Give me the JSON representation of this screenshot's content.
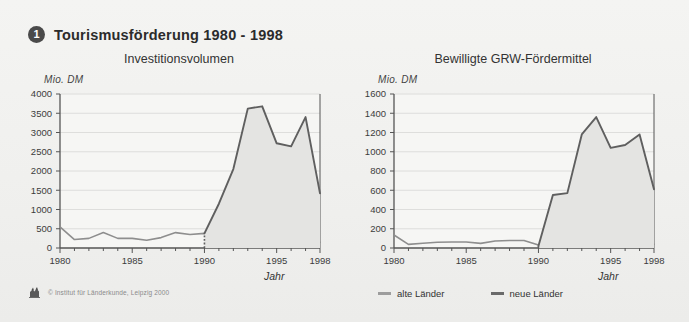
{
  "header": {
    "badge": "1",
    "title": "Tourismusförderung 1980 - 1998"
  },
  "legend": {
    "items": [
      {
        "label": "alte Länder",
        "color": "#9d9d9d"
      },
      {
        "label": "neue Länder",
        "color": "#6a6a6a"
      }
    ]
  },
  "footer": {
    "copyright": "© Institut für Länderkunde, Leipzig 2000",
    "logo_icon": "institute-logo-icon"
  },
  "colors": {
    "line_alte": "#8e8e8e",
    "line_neue": "#5f5f5f",
    "area_fill": "#e4e4e2",
    "grid": "#d8d8d6",
    "axis": "#555555",
    "plot_bg": "#f6f6f4"
  },
  "chart_data": [
    {
      "type": "line",
      "id": "investitionsvolumen",
      "title": "Investitionsvolumen",
      "ylabel": "Mio. DM",
      "xlabel": "Jahr",
      "ylim": [
        0,
        4000
      ],
      "yticks": [
        0,
        500,
        1000,
        1500,
        2000,
        2500,
        3000,
        3500,
        4000
      ],
      "xlim": [
        1980,
        1998
      ],
      "xticks": [
        1980,
        1985,
        1990,
        1995,
        1998
      ],
      "xtick_minor_step": 1,
      "grid": true,
      "legend_position": "below-figure",
      "x": [
        1980,
        1981,
        1982,
        1983,
        1984,
        1985,
        1986,
        1987,
        1988,
        1989,
        1990,
        1991,
        1992,
        1993,
        1994,
        1995,
        1996,
        1997,
        1998
      ],
      "series": [
        {
          "name": "alte Länder",
          "color": "#8e8e8e",
          "values": [
            550,
            220,
            250,
            400,
            250,
            250,
            200,
            270,
            400,
            350,
            380,
            320,
            450,
            300,
            300,
            300,
            290,
            180,
            150
          ]
        },
        {
          "name": "neue Länder",
          "color": "#5f5f5f",
          "filled": true,
          "starts_year": 1990,
          "dotted_from": [
            1990,
            0
          ],
          "values": [
            null,
            null,
            null,
            null,
            null,
            null,
            null,
            null,
            null,
            null,
            380,
            1150,
            2050,
            3620,
            3680,
            2720,
            2640,
            3400,
            1420
          ]
        }
      ]
    },
    {
      "type": "line",
      "id": "bewilligte-grw-foerdermittel",
      "title": "Bewilligte GRW-Fördermittel",
      "ylabel": "Mio. DM",
      "xlabel": "Jahr",
      "ylim": [
        0,
        1600
      ],
      "yticks": [
        0,
        200,
        400,
        600,
        800,
        1000,
        1200,
        1400,
        1600
      ],
      "xlim": [
        1980,
        1998
      ],
      "xticks": [
        1980,
        1985,
        1990,
        1995,
        1998
      ],
      "xtick_minor_step": 1,
      "grid": true,
      "legend_position": "below-figure",
      "x": [
        1980,
        1981,
        1982,
        1983,
        1984,
        1985,
        1986,
        1987,
        1988,
        1989,
        1990,
        1991,
        1992,
        1993,
        1994,
        1995,
        1996,
        1997,
        1998
      ],
      "series": [
        {
          "name": "alte Länder",
          "color": "#8e8e8e",
          "values": [
            135,
            38,
            50,
            60,
            62,
            62,
            48,
            72,
            78,
            78,
            30,
            60,
            78,
            80,
            48,
            52,
            50,
            42,
            38
          ]
        },
        {
          "name": "neue Länder",
          "color": "#5f5f5f",
          "filled": true,
          "starts_year": 1990,
          "dotted_from": [
            1990,
            0
          ],
          "values": [
            null,
            null,
            null,
            null,
            null,
            null,
            null,
            null,
            null,
            null,
            20,
            550,
            570,
            1180,
            1360,
            1040,
            1070,
            1180,
            610
          ]
        }
      ]
    }
  ]
}
